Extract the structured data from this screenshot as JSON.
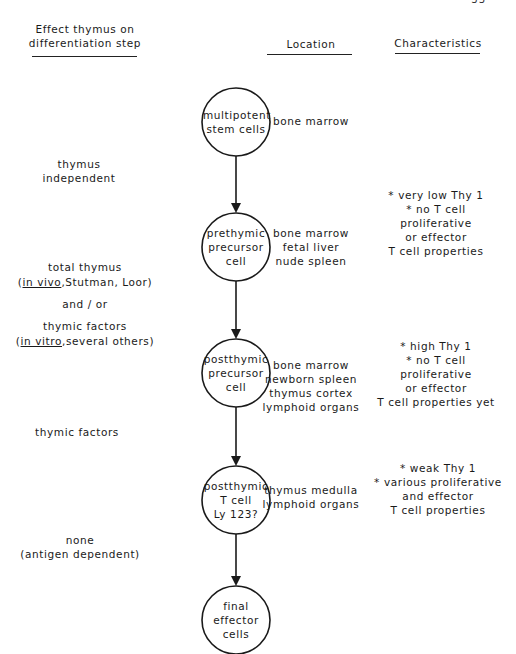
{
  "page": {
    "number_partial": "33"
  },
  "headers": {
    "effect": [
      "Effect thymus on",
      "differentiation step"
    ],
    "location": "Location",
    "characteristics": "Characteristics"
  },
  "stages": [
    {
      "cell": [
        "multipotent",
        "stem cells"
      ],
      "location": [
        "bone marrow"
      ],
      "characteristics": []
    },
    {
      "cell": [
        "prethymic",
        "precursor",
        "cell"
      ],
      "location": [
        "bone marrow",
        "fetal liver",
        "nude spleen"
      ],
      "characteristics": [
        "* very low Thy 1",
        "* no T cell",
        "proliferative",
        "or effector",
        "T cell properties"
      ]
    },
    {
      "cell": [
        "postthymic",
        "precursor",
        "cell"
      ],
      "location": [
        "bone marrow",
        "newborn spleen",
        "thymus cortex",
        "lymphoid organs"
      ],
      "characteristics": [
        "* high Thy 1",
        "* no T cell",
        "proliferative",
        "or effector",
        "T cell properties yet"
      ]
    },
    {
      "cell": [
        "postthymic",
        "T cell",
        "Ly 123?"
      ],
      "location": [
        "thymus medulla",
        "lymphoid organs"
      ],
      "characteristics": [
        "* weak Thy 1",
        "* various proliferative",
        "and effector",
        "T cell properties"
      ]
    },
    {
      "cell": [
        "final",
        "effector",
        "cells"
      ],
      "location": [],
      "characteristics": []
    }
  ],
  "transitions": [
    {
      "lines": [
        "thymus",
        "independent"
      ]
    },
    {
      "line1": "total thymus",
      "line2_underlined": "in vivo",
      "line2_rest": ",Stutman, Loor",
      "line3": "and / or",
      "line4": "thymic factors",
      "line5_underlined": "in vitro",
      "line5_rest": ",several others"
    },
    {
      "lines": [
        "thymic factors"
      ]
    },
    {
      "lines": [
        "none",
        "(antigen dependent)"
      ]
    }
  ],
  "colors": {
    "ink": "#1a1a1a",
    "background": "#ffffff"
  }
}
